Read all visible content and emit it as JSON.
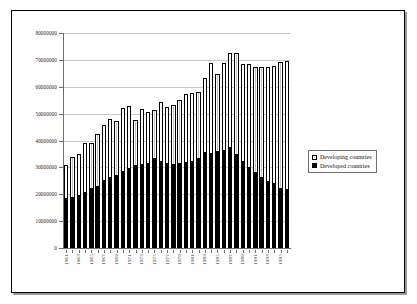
{
  "legend": {
    "position": "right-middle",
    "entries": [
      {
        "label": "Developing countries",
        "swatch": "open-square",
        "color": "#ffffff"
      },
      {
        "label": "Developed countries",
        "swatch": "filled-square",
        "color": "#000000"
      }
    ]
  },
  "chart_data": {
    "type": "bar",
    "stacked": true,
    "title": "",
    "subtitle": "",
    "xlabel": "",
    "ylabel": "",
    "grid": true,
    "ylim": [
      0,
      80000000
    ],
    "ytick_step": 10000000,
    "yticks": [
      0,
      10000000,
      20000000,
      30000000,
      40000000,
      50000000,
      60000000,
      70000000,
      80000000
    ],
    "ytick_labels": [
      "0",
      "10000000",
      "20000000",
      "30000000",
      "40000000",
      "50000000",
      "60000000",
      "70000000",
      "80000000"
    ],
    "xtick_label_step": 2,
    "categories": [
      "1961",
      "1962",
      "1963",
      "1964",
      "1965",
      "1966",
      "1967",
      "1968",
      "1969",
      "1970",
      "1971",
      "1972",
      "1973",
      "1974",
      "1975",
      "1976",
      "1977",
      "1978",
      "1979",
      "1980",
      "1981",
      "1982",
      "1983",
      "1984",
      "1985",
      "1986",
      "1987",
      "1988",
      "1989",
      "1990",
      "1991",
      "1992",
      "1993",
      "1994",
      "1995",
      "1996"
    ],
    "series": [
      {
        "name": "Developed countries",
        "color": "#000000",
        "values": [
          18700000,
          19000000,
          19900000,
          20700000,
          22200000,
          23200000,
          25300000,
          26300000,
          27300000,
          28700000,
          29800000,
          30900000,
          31400000,
          31500000,
          33500000,
          32300000,
          31700000,
          31200000,
          31700000,
          31900000,
          32300000,
          33500000,
          35600000,
          35200000,
          36100000,
          36500000,
          37600000,
          34900000,
          32400000,
          30000000,
          28100000,
          26300000,
          25000000,
          24200000,
          22200000,
          21900000
        ]
      },
      {
        "name": "Developing countries",
        "color": "#ffffff",
        "values": [
          12200000,
          14700000,
          15200000,
          18200000,
          17000000,
          19200000,
          20300000,
          21600000,
          19800000,
          23300000,
          23200000,
          16900000,
          20300000,
          19100000,
          18000000,
          22200000,
          20900000,
          22000000,
          23200000,
          25500000,
          25400000,
          24700000,
          27800000,
          33700000,
          28700000,
          32400000,
          34800000,
          37700000,
          36200000,
          38500000,
          39400000,
          41100000,
          42500000,
          43700000,
          47000000,
          47700000
        ]
      }
    ],
    "totals": [
      30900000,
      33700000,
      35100000,
      38900000,
      39200000,
      42400000,
      45600000,
      47900000,
      47100000,
      52000000,
      53000000,
      47800000,
      51700000,
      50600000,
      51500000,
      54500000,
      52600000,
      53200000,
      54900000,
      57400000,
      57700000,
      58200000,
      63400000,
      68900000,
      64800000,
      68900000,
      72400000,
      72600000,
      68600000,
      68500000,
      67500000,
      67400000,
      67500000,
      67900000,
      69200000,
      69600000
    ]
  }
}
